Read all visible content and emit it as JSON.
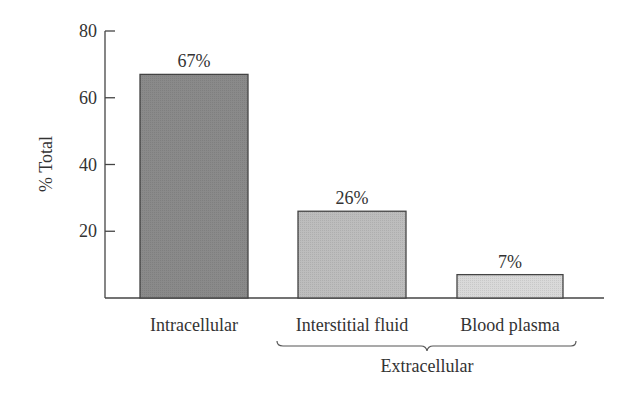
{
  "chart_data": {
    "type": "bar",
    "title": "",
    "xlabel": "",
    "ylabel": "% Total",
    "ylim": [
      0,
      80
    ],
    "yticks": [
      20,
      40,
      60,
      80
    ],
    "categories": [
      "Intracellular",
      "Interstitial fluid",
      "Blood plasma"
    ],
    "values": [
      67,
      26,
      7
    ],
    "data_labels": [
      "67%",
      "26%",
      "7%"
    ],
    "bar_colors": [
      "#8a8a8a",
      "#bdbdbd",
      "#d9d9d9"
    ],
    "group_annotation": {
      "label": "Extracellular",
      "spans": [
        "Interstitial fluid",
        "Blood plasma"
      ]
    },
    "grid": false,
    "legend": null
  }
}
